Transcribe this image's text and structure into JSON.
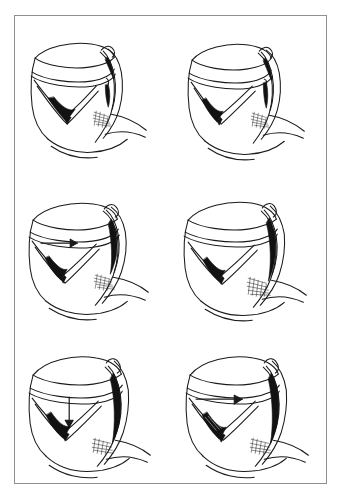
{
  "figure": {
    "kind": "medical-line-illustration",
    "title_visible": false,
    "caption_visible": false,
    "background_color": "#ffffff",
    "frame": {
      "stroke_color": "#8d8f93",
      "stroke_width_px": 1,
      "x": 14,
      "y": 15,
      "width": 313,
      "height": 469
    },
    "ink_color": "#1a1a1a",
    "shadow_color": "#111111",
    "hatch_color": "#2b2b2b",
    "grid": {
      "columns": 2,
      "rows": 3,
      "total_panels": 6
    }
  },
  "panels": [
    {
      "id": "panel-1",
      "position": "top-left",
      "label": "",
      "subject": "larynx with laryngoscope blade inserted, vocal cords shown as dark V",
      "arrow": {
        "present": false,
        "direction": "",
        "glyph": ""
      },
      "has_dark_cord_wedge": true,
      "has_hatched_shading": true,
      "instrument_visible": true
    },
    {
      "id": "panel-2",
      "position": "top-right",
      "label": "",
      "subject": "larynx with laryngoscope blade rotated, cords narrowed",
      "arrow": {
        "present": false,
        "direction": "",
        "glyph": ""
      },
      "has_dark_cord_wedge": true,
      "has_hatched_shading": true,
      "instrument_visible": true
    },
    {
      "id": "panel-3",
      "position": "middle-left",
      "label": "",
      "subject": "larynx with instrument advanced, horizontal arrow indicating direction of push",
      "arrow": {
        "present": true,
        "direction": "right",
        "glyph": "→"
      },
      "has_dark_cord_wedge": true,
      "has_hatched_shading": true,
      "instrument_visible": true
    },
    {
      "id": "panel-4",
      "position": "middle-right",
      "label": "",
      "subject": "larynx with instrument seated, elongated dark blade shadow",
      "arrow": {
        "present": false,
        "direction": "",
        "glyph": ""
      },
      "has_dark_cord_wedge": true,
      "has_hatched_shading": true,
      "instrument_visible": true
    },
    {
      "id": "panel-5",
      "position": "bottom-left",
      "label": "",
      "subject": "larynx with downward arrow indicating inferior traction",
      "arrow": {
        "present": true,
        "direction": "down",
        "glyph": "↓"
      },
      "has_dark_cord_wedge": true,
      "has_hatched_shading": true,
      "instrument_visible": true
    },
    {
      "id": "panel-6",
      "position": "bottom-right",
      "label": "",
      "subject": "larynx with horizontal arrow, cords hatched, instrument fully engaged",
      "arrow": {
        "present": true,
        "direction": "right",
        "glyph": "→"
      },
      "has_dark_cord_wedge": true,
      "has_hatched_shading": true,
      "instrument_visible": true
    }
  ]
}
